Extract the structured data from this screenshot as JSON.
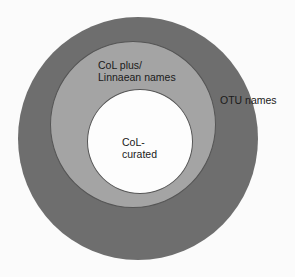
{
  "diagram": {
    "type": "nested-circles",
    "rings": [
      {
        "id": "outer",
        "label": "OTU names",
        "color": "#6e6e6e"
      },
      {
        "id": "middle",
        "label_line1": "CoL plus/",
        "label_line2": "Linnaean names",
        "color": "#a4a4a4"
      },
      {
        "id": "inner",
        "label_line1": "CoL-",
        "label_line2": "curated",
        "color": "#fdfdfd"
      }
    ]
  }
}
